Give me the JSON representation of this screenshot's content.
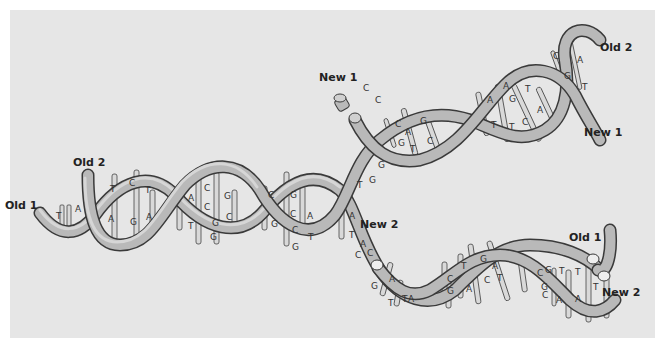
{
  "figure": {
    "background": "#e6e6e6",
    "tube_color": "#b9b9b9",
    "outline_color": "#3a3a3a"
  },
  "labels": {
    "old1_left": "Old 1",
    "old2_left": "Old 2",
    "new1_top": "New 1",
    "new1_right": "New 1",
    "old2_right": "Old 2",
    "new2_middle": "New 2",
    "old1_right": "Old 1",
    "new2_right": "New 2"
  },
  "parent_helix": {
    "pairs": [
      {
        "top": "T",
        "bottom": "A"
      },
      {
        "top": "T",
        "bottom": "A"
      },
      {
        "top": "C",
        "bottom": "G"
      },
      {
        "top": "T",
        "bottom": "A"
      },
      {
        "top": "A",
        "bottom": "T"
      },
      {
        "top": "C",
        "bottom": "G"
      },
      {
        "top": "C",
        "bottom": "G"
      },
      {
        "top": "G",
        "bottom": "C"
      },
      {
        "top": "C",
        "bottom": "G"
      },
      {
        "top": "G",
        "bottom": "C"
      },
      {
        "top": "C",
        "bottom": "G"
      },
      {
        "top": "A",
        "bottom": "T"
      }
    ]
  },
  "upper_daughter": {
    "loose_bases": [
      "C",
      "C",
      "G",
      "G",
      "T"
    ],
    "pairs": [
      {
        "top": "C",
        "bottom": "G"
      },
      {
        "top": "A",
        "bottom": "T"
      },
      {
        "top": "G",
        "bottom": "C"
      },
      {
        "top": "A",
        "bottom": "T"
      },
      {
        "top": "A",
        "bottom": "T"
      },
      {
        "top": "G",
        "bottom": "C"
      },
      {
        "top": "T",
        "bottom": "A"
      },
      {
        "top": "C",
        "bottom": "G"
      },
      {
        "top": "A",
        "bottom": "T"
      }
    ]
  },
  "lower_daughter": {
    "loose_bases": [
      "A",
      "T",
      "A",
      "C",
      "C",
      "G",
      "A",
      "T",
      "T",
      "A"
    ],
    "pairs": [
      {
        "top": "C",
        "bottom": "G"
      },
      {
        "top": "T",
        "bottom": "A"
      },
      {
        "top": "G",
        "bottom": "C"
      },
      {
        "top": "A",
        "bottom": "T"
      },
      {
        "top": "C",
        "bottom": "G"
      },
      {
        "top": "G",
        "bottom": "C"
      },
      {
        "top": "T",
        "bottom": "A"
      },
      {
        "top": "T",
        "bottom": "A"
      }
    ],
    "end_base": "T"
  }
}
